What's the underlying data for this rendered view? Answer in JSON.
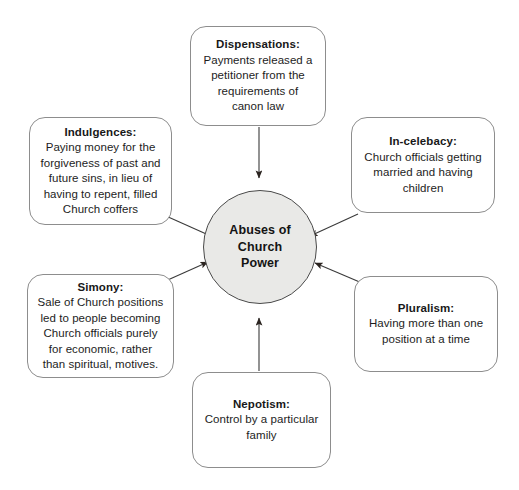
{
  "diagram": {
    "center": {
      "label": "Abuses of\nChurch\nPower",
      "fill_color": "#e9e9e7",
      "stroke_color": "#4a4a4a"
    },
    "background_color": "#ffffff",
    "node_border_color": "#8d8d8d",
    "arrow_color": "#2b2420",
    "nodes": [
      {
        "id": "dispensations",
        "title": "Dispensations:",
        "body": "Payments released a\npetitioner from the\nrequirements of\ncanon law"
      },
      {
        "id": "indulgences",
        "title": "Indulgences:",
        "body": "Paying money for the\nforgiveness of past and\nfuture sins, in lieu of\nhaving to repent, filled\nChurch coffers"
      },
      {
        "id": "incelebacy",
        "title": "In-celebacy:",
        "body": "Church officials getting\nmarried and having\nchildren"
      },
      {
        "id": "pluralism",
        "title": "Pluralism:",
        "body": "Having more than one\nposition at a time"
      },
      {
        "id": "simony",
        "title": "Simony:",
        "body": "Sale of Church positions\nled to people becoming\nChurch officials purely\nfor economic, rather\nthan spiritual, motives."
      },
      {
        "id": "nepotism",
        "title": "Nepotism:",
        "body": "Control by a particular\nfamily"
      }
    ]
  }
}
